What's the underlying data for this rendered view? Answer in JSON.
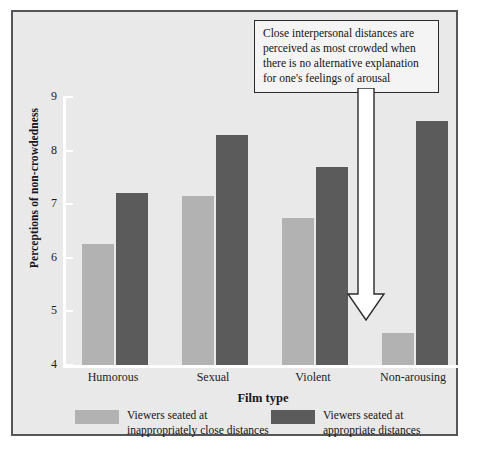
{
  "chart_data": {
    "type": "bar",
    "categories": [
      "Humorous",
      "Sexual",
      "Violent",
      "Non-arousing"
    ],
    "series": [
      {
        "name": "Viewers seated at\ninappropriately close distances",
        "color": "#b2b2b2",
        "values": [
          6.25,
          7.15,
          6.75,
          4.6
        ]
      },
      {
        "name": "Viewers seated at\nappropriate distances",
        "color": "#5b5b5b",
        "values": [
          7.2,
          8.3,
          7.7,
          8.55
        ]
      }
    ],
    "title": "",
    "xlabel": "Film type",
    "ylabel": "Perceptions of non-crowdedness",
    "ylim": [
      4,
      9
    ],
    "yticks": [
      4,
      5,
      6,
      7,
      8,
      9
    ],
    "ytick_labels": [
      "4",
      "5",
      "6",
      "7",
      "8",
      "9"
    ],
    "grid": false,
    "legend_position": "bottom",
    "annotations": [
      {
        "text": "Close interpersonal distances are perceived as most crowded when there is no alternative explanation for one's feelings of arousal",
        "points_to": "Non-arousing / inappropriately close distances bar"
      }
    ]
  },
  "figure": {
    "background_color": "#e9e9e9",
    "border_color": "#55565a",
    "axis_color": "#ffffff"
  }
}
